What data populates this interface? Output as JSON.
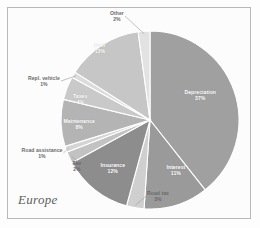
{
  "caption": "Europe",
  "chart_data": {
    "type": "pie",
    "title": "Europe",
    "xlabel": "",
    "ylabel": "",
    "legend": "none",
    "grid": false,
    "value_suffix": "%",
    "categories": [
      "Depreciation",
      "Interest",
      "Road tax",
      "Insurance",
      "Fee",
      "Road assistance",
      "Maintenance",
      "Taxes",
      "Repl. vehicle",
      "Fuel",
      "Other"
    ],
    "values": [
      37,
      11,
      3,
      12,
      2,
      1,
      8,
      4,
      1,
      13,
      2
    ],
    "slices": [
      {
        "label": "Depreciation",
        "value": 37,
        "display": "37%",
        "color": "#a0a0a0",
        "label_placement": "inside",
        "x": 200,
        "y": 95
      },
      {
        "label": "Interest",
        "value": 11,
        "display": "11%",
        "color": "#9a9a9a",
        "label_placement": "inside",
        "x": 176,
        "y": 170
      },
      {
        "label": "Road tax",
        "value": 3,
        "display": "3%",
        "color": "#cfcfcf",
        "label_placement": "outside",
        "x": 158,
        "y": 196
      },
      {
        "label": "Insurance",
        "value": 12,
        "display": "12%",
        "color": "#8d8d8d",
        "label_placement": "inside",
        "x": 113,
        "y": 168
      },
      {
        "label": "Fee",
        "value": 2,
        "display": "2%",
        "color": "#c2c2c2",
        "label_placement": "outside",
        "x": 77,
        "y": 166
      },
      {
        "label": "Road assistance",
        "value": 1,
        "display": "1%",
        "color": "#d4d4d4",
        "label_placement": "outside",
        "x": 42,
        "y": 153
      },
      {
        "label": "Maintenance",
        "value": 8,
        "display": "8%",
        "color": "#b4b4b4",
        "label_placement": "inside",
        "x": 79,
        "y": 124
      },
      {
        "label": "Taxes",
        "value": 4,
        "display": "4%",
        "color": "#c9c9c9",
        "label_placement": "inside",
        "x": 80,
        "y": 99
      },
      {
        "label": "Repl. vehicle",
        "value": 1,
        "display": "1%",
        "color": "#dcdcdc",
        "label_placement": "outside",
        "x": 44,
        "y": 81
      },
      {
        "label": "Fuel",
        "value": 13,
        "display": "13%",
        "color": "#c6c6c6",
        "label_placement": "inside",
        "x": 100,
        "y": 48
      },
      {
        "label": "Other",
        "value": 2,
        "display": "2%",
        "color": "#e2e2e2",
        "label_placement": "outside",
        "x": 117,
        "y": 16
      }
    ],
    "colors": {
      "background": "#fcfcfc",
      "border": "#b9b9b9",
      "slice_separator": "#ffffff",
      "leader_line": "#9c9c9c",
      "inside_label": "#ffffff",
      "outside_label": "#6a6a6a",
      "caption": "#5e5e5e"
    },
    "geometry": {
      "center_x": 150,
      "center_y": 120,
      "radius": 89
    }
  }
}
